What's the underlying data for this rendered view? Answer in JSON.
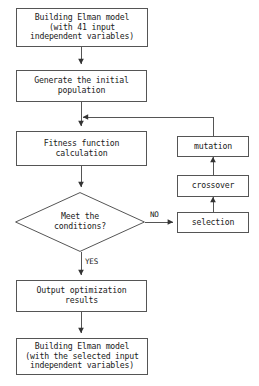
{
  "diagram": {
    "type": "flowchart",
    "background_color": "#ffffff",
    "line_color": "#555555",
    "text_color": "#1a1a1a"
  },
  "nodes": {
    "build_model_initial": {
      "label": "Building Elman model\n(with 41 input\nindependent variables)",
      "shape": "rectangle"
    },
    "generate_population": {
      "label": "Generate the initial\npopulation",
      "shape": "rectangle"
    },
    "fitness_function": {
      "label": "Fitness function\ncalculation",
      "shape": "rectangle"
    },
    "meet_conditions": {
      "label": "Meet the\nconditions?",
      "shape": "diamond"
    },
    "output_results": {
      "label": "Output optimization\nresults",
      "shape": "rectangle"
    },
    "build_model_final": {
      "label": "Building Elman model\n(with the selected input\nindependent variables)",
      "shape": "rectangle"
    },
    "selection": {
      "label": "selection",
      "shape": "rectangle"
    },
    "crossover": {
      "label": "crossover",
      "shape": "rectangle"
    },
    "mutation": {
      "label": "mutation",
      "shape": "rectangle"
    }
  },
  "edge_labels": {
    "no": "NO",
    "yes": "YES"
  }
}
